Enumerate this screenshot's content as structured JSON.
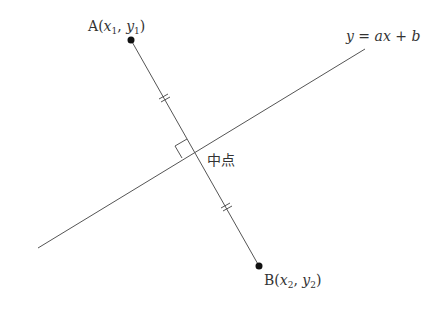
{
  "diagram": {
    "title": "",
    "point_a": {
      "name": "A",
      "x_sub": "1",
      "y_sub": "1",
      "x_var": "x",
      "y_var": "y",
      "open": "(",
      "comma": ", ",
      "close": ")"
    },
    "point_b": {
      "name": "B",
      "x_sub": "2",
      "y_sub": "2",
      "x_var": "x",
      "y_var": "y",
      "open": "(",
      "comma": ", ",
      "close": ")"
    },
    "line_equation": {
      "lhs": "y",
      "eq": " = ",
      "a": "a",
      "x": "x",
      "plus": " + ",
      "b": "b"
    },
    "midpoint_label": "中点",
    "colors": {
      "line": "#555555",
      "point": "#111111",
      "text": "#333333",
      "background": "#ffffff"
    }
  }
}
